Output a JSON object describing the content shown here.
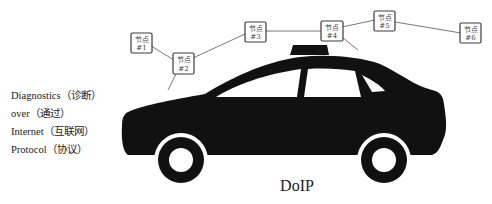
{
  "diagram": {
    "title": "DoIP",
    "acronym_lines": [
      "Diagnostics（诊断）",
      "over（通过）",
      "Internet（互联网）",
      "Protocol（协议）"
    ],
    "nodes": [
      {
        "label": "节点",
        "id_label": "#1"
      },
      {
        "label": "节点",
        "id_label": "#2"
      },
      {
        "label": "节点",
        "id_label": "#3"
      },
      {
        "label": "节点",
        "id_label": "#4"
      },
      {
        "label": "节点",
        "id_label": "#5"
      },
      {
        "label": "节点",
        "id_label": "#6"
      }
    ],
    "connections": [
      [
        "#1",
        "#2"
      ],
      [
        "#2",
        "#3"
      ],
      [
        "#3",
        "#4"
      ],
      [
        "#4",
        "#5"
      ],
      [
        "#5",
        "#6"
      ]
    ],
    "vehicle": "car-silhouette",
    "colors": {
      "car": "#111111",
      "node_border": "#3a3a3a",
      "line": "#555555",
      "text": "#222222"
    }
  }
}
